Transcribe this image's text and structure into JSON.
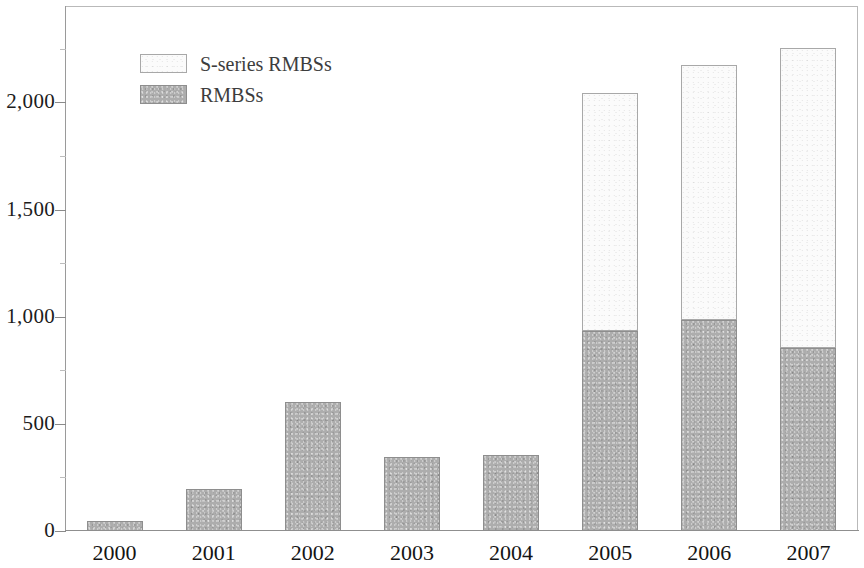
{
  "chart_data": {
    "type": "bar",
    "stacked": true,
    "title": "",
    "subtitle": "",
    "xlabel": "",
    "ylabel": "",
    "categories": [
      "2000",
      "2001",
      "2002",
      "2003",
      "2004",
      "2005",
      "2006",
      "2007"
    ],
    "series": [
      {
        "name": "RMBSs",
        "color": "#adadad",
        "values": [
          45,
          195,
          600,
          345,
          355,
          935,
          985,
          855
        ]
      },
      {
        "name": "S-series RMBSs",
        "color": "#fbfbfb",
        "values": [
          0,
          0,
          0,
          0,
          0,
          1110,
          1190,
          1400
        ]
      }
    ],
    "totals": [
      45,
      195,
      600,
      345,
      355,
      2045,
      2175,
      2255
    ],
    "ylim": [
      0,
      2450
    ],
    "yticks": [
      0,
      500,
      1000,
      1500,
      2000
    ],
    "ytick_labels": [
      "0",
      "500",
      "1,000",
      "1,500",
      "2,000"
    ],
    "y_minor_ticks": [
      250,
      750,
      1250,
      1750,
      2250
    ],
    "grid": false,
    "legend_position": "top-left",
    "stack_order_top_to_bottom": [
      "S-series RMBSs",
      "RMBSs"
    ]
  },
  "legend": {
    "items": [
      {
        "label": "S-series RMBSs",
        "swatch": "light-swatch"
      },
      {
        "label": "RMBSs",
        "swatch": "gray-swatch"
      }
    ]
  },
  "axes": {
    "y": {
      "labels": [
        "2,000",
        "1,500",
        "1,000",
        "500",
        "0"
      ]
    },
    "x": {
      "labels": [
        "2000",
        "2001",
        "2002",
        "2003",
        "2004",
        "2005",
        "2006",
        "2007"
      ]
    }
  }
}
